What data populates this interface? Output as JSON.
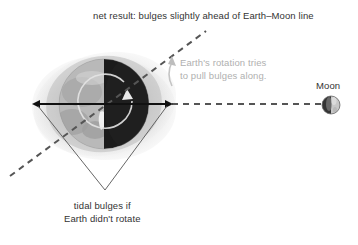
{
  "figure": {
    "background_color": "#ffffff"
  },
  "captions": {
    "net_result": "net result: bulges slightly ahead of Earth–Moon line",
    "tidal_bulges_line1": "tidal bulges if",
    "tidal_bulges_line2": "Earth didn't rotate",
    "rotation_line1": "Earth's rotation tries",
    "rotation_line2": "to pull bulges along."
  },
  "labels": {
    "moon": "Moon"
  },
  "colors": {
    "text": "#333333",
    "gray_annotation": "#b0b0b0",
    "dashed_line": "#555555",
    "solid_arrow": "#111111",
    "leader_line": "#555555",
    "bulge_fill": "#c9c9c9",
    "bulge_fill_light": "#e2e2e2",
    "earth_day": "#b5b5b5",
    "earth_night": "#1c1c1c",
    "moon_dark": "#3a3a3a",
    "moon_light": "#cfcfcf"
  },
  "elements": {
    "earth": {
      "name": "Earth",
      "center_x": 104,
      "center_y": 104,
      "radius": 45,
      "night_side": "right"
    },
    "moon": {
      "name": "Moon",
      "center_x": 331,
      "center_y": 105,
      "radius": 9
    },
    "bulge_axis_arrow": {
      "description": "double-headed arrow along tidal bulge axis",
      "x1": 38,
      "y1": 104,
      "x2": 167,
      "y2": 104
    },
    "earth_moon_line": {
      "description": "dashed line from Earth to Moon",
      "x1": 170,
      "y1": 104,
      "x2": 320,
      "y2": 104
    },
    "bulge_offset_line": {
      "description": "dashed line showing bulges rotated ahead of Earth-Moon line",
      "x1": 10,
      "y1": 176,
      "x2": 206,
      "y2": 31
    },
    "rotation_arrow": {
      "description": "circular arrow showing Earth's counterclockwise rotation",
      "center_x": 105,
      "center_y": 101,
      "radius": 27
    }
  }
}
